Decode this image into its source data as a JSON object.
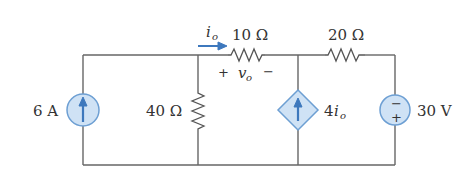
{
  "circuit": {
    "current_source": {
      "label": "6 A",
      "direction": "up"
    },
    "resistor_shunt": {
      "label": "40 Ω"
    },
    "resistor_series_1": {
      "label": "10 Ω"
    },
    "resistor_series_2": {
      "label": "20 Ω"
    },
    "dependent_source": {
      "label_coef": "4",
      "label_var": "i",
      "label_sub": "o",
      "direction": "up"
    },
    "voltage_source": {
      "label": "30 V",
      "top_sign": "−",
      "bottom_sign": "+"
    },
    "current_io": {
      "var": "i",
      "sub": "o"
    },
    "voltage_vo": {
      "var": "v",
      "sub": "o",
      "plus": "+",
      "minus": "−"
    }
  },
  "colors": {
    "wire": "#666666",
    "source_fill": "#cfe2f5",
    "source_stroke": "#6d9fd3",
    "arrow": "#3d78bd"
  }
}
